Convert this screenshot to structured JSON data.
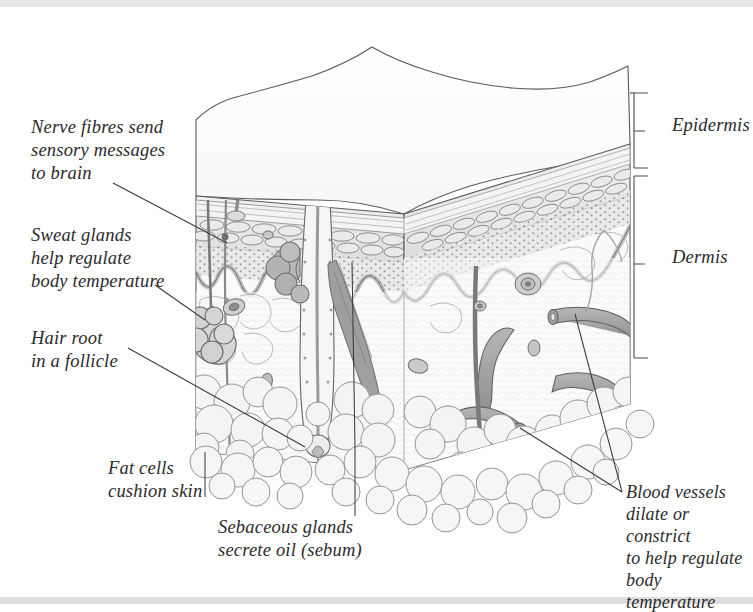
{
  "figure": {
    "style": "pen-and-ink anatomical illustration, grey wash",
    "background_color": "#ffffff",
    "ink_color": "#4a4a4a",
    "text_color": "#2b2b2b",
    "band_color": "#e8e8ea"
  },
  "labels": {
    "nerve": "Nerve fibres send\nsensory messages\nto brain",
    "sweat": "Sweat glands\nhelp regulate\nbody temperature",
    "hair": "Hair root\nin a follicle",
    "fat": "Fat cells\ncushion skin",
    "sebaceous": "Sebaceous glands\nsecrete oil (sebum)",
    "blood": "Blood vessels\ndilate or constrict\nto help regulate\nbody temperature"
  },
  "layers": {
    "epidermis": "Epidermis",
    "dermis": "Dermis"
  },
  "structures": [
    "hair shaft",
    "hair root in follicle",
    "hair bulb and papilla",
    "stratum corneum",
    "epidermal cell layers",
    "dermal-epidermal junction",
    "coiled sweat gland",
    "sweat duct",
    "sebaceous gland",
    "arrector pili muscle",
    "nerve fibre",
    "blood vessels",
    "subcutaneous fat cells"
  ]
}
